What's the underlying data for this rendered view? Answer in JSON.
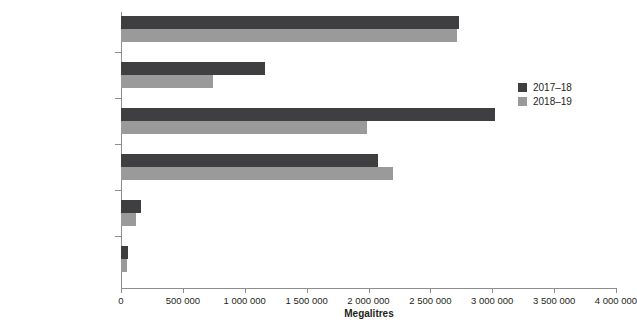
{
  "chart_data": {
    "type": "bar",
    "orientation": "horizontal",
    "title": "",
    "xlabel": "Megalitres",
    "ylabel": "",
    "xlim": [
      0,
      4000000
    ],
    "xticks": [
      0,
      500000,
      1000000,
      1500000,
      2000000,
      2500000,
      3000000,
      3500000,
      4000000
    ],
    "xticklabels": [
      "0",
      "500 000",
      "1 000 000",
      "1 500 000",
      "2 000 000",
      "2 500 000",
      "3 000 000",
      "3 500 000",
      "4 000 000"
    ],
    "categories": [
      "Irrigation",
      "On-farm dams or tanks",
      "Rivers, creeks, lakes",
      "Groundwater",
      "Recycled",
      "Reticulated mains"
    ],
    "series": [
      {
        "name": "2017–18",
        "color": "#3f3f41",
        "values": [
          2730000,
          1160000,
          3020000,
          2080000,
          160000,
          56000
        ]
      },
      {
        "name": "2018–19",
        "color": "#9a9a9a",
        "values": [
          2715000,
          745000,
          1990000,
          2200000,
          120000,
          52000
        ]
      }
    ],
    "grid": false,
    "legend_position": "right"
  },
  "legend": {
    "items": [
      {
        "label": "2017–18",
        "color": "#3f3f41"
      },
      {
        "label": "2018–19",
        "color": "#9a9a9a"
      }
    ]
  },
  "axis": {
    "x_title": "Megalitres"
  }
}
